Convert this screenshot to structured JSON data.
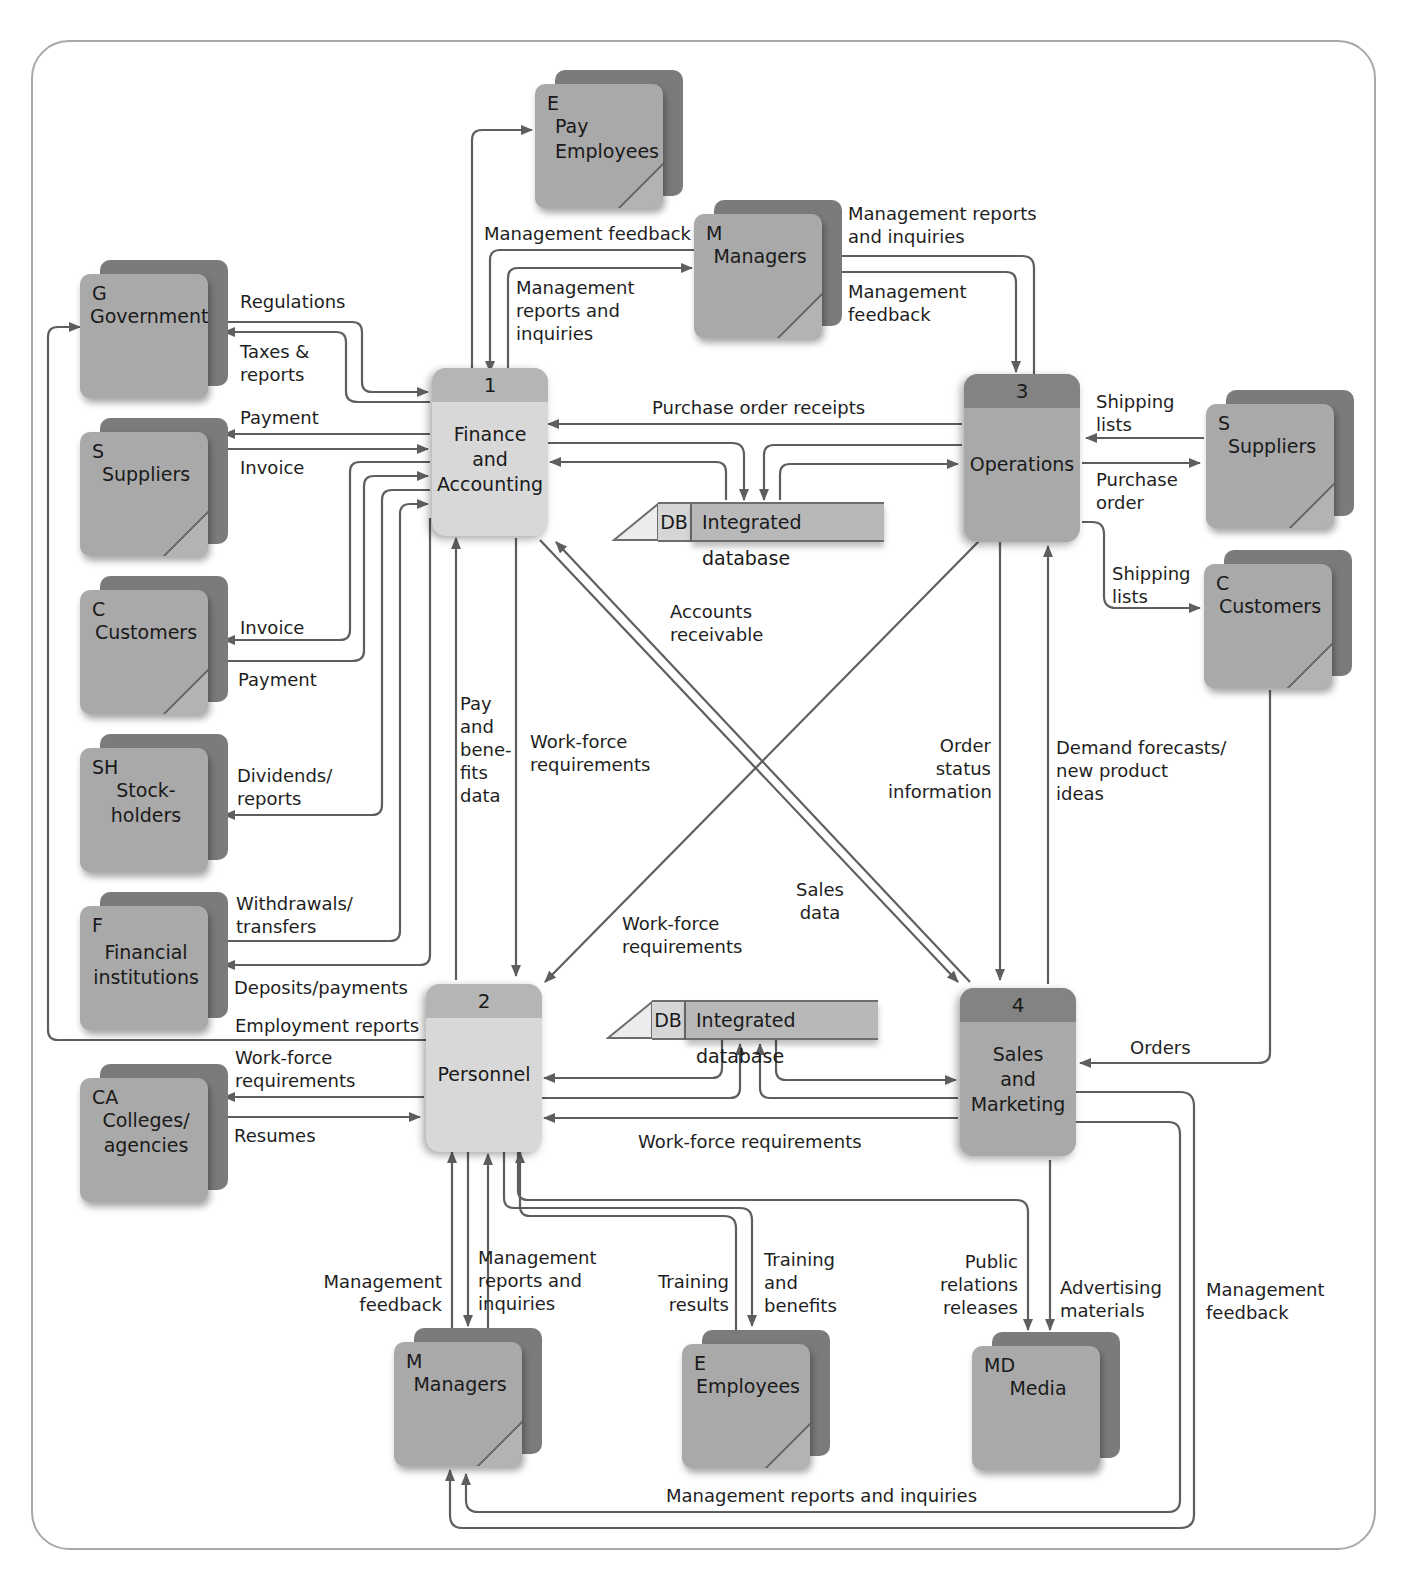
{
  "diagram": {
    "type": "data-flow-diagram",
    "processes": [
      {
        "id": "1",
        "name": "Finance and Accounting",
        "lines": [
          "Finance",
          "and",
          "Accounting"
        ]
      },
      {
        "id": "2",
        "name": "Personnel",
        "lines": [
          "Personnel"
        ]
      },
      {
        "id": "3",
        "name": "Operations",
        "lines": [
          "Operations"
        ]
      },
      {
        "id": "4",
        "name": "Sales and Marketing",
        "lines": [
          "Sales",
          "and",
          "Marketing"
        ]
      }
    ],
    "data_stores": [
      {
        "id": "DB",
        "name": "Integrated database"
      },
      {
        "id": "DB",
        "name": "Integrated database"
      }
    ],
    "entities": {
      "pay_employees": {
        "code": "E",
        "lines": [
          "Pay",
          "Employees"
        ]
      },
      "managers_top": {
        "code": "M",
        "lines": [
          "Managers"
        ]
      },
      "government": {
        "code": "G",
        "lines": [
          "Government"
        ]
      },
      "suppliers_left": {
        "code": "S",
        "lines": [
          "Suppliers"
        ]
      },
      "customers_left": {
        "code": "C",
        "lines": [
          "Customers"
        ]
      },
      "stockholders": {
        "code": "SH",
        "lines": [
          "Stock-",
          "holders"
        ]
      },
      "financial_institutions": {
        "code": "F",
        "lines": [
          "Financial",
          "institutions"
        ]
      },
      "colleges": {
        "code": "CA",
        "lines": [
          "Colleges/",
          "agencies"
        ]
      },
      "suppliers_right": {
        "code": "S",
        "lines": [
          "Suppliers"
        ]
      },
      "customers_right": {
        "code": "C",
        "lines": [
          "Customers"
        ]
      },
      "managers_bottom": {
        "code": "M",
        "lines": [
          "Managers"
        ]
      },
      "employees": {
        "code": "E",
        "lines": [
          "Employees"
        ]
      },
      "media": {
        "code": "MD",
        "lines": [
          "Media"
        ]
      }
    },
    "flows": {
      "mgmt_feedback_top": [
        "Management feedback"
      ],
      "mgmt_reports_top_left": [
        "Management",
        "reports and",
        "inquiries"
      ],
      "mgmt_reports_top_right": [
        "Management reports",
        "and inquiries"
      ],
      "mgmt_feedback_top_right": [
        "Management",
        "feedback"
      ],
      "regulations": [
        "Regulations"
      ],
      "taxes": [
        "Taxes &",
        "reports"
      ],
      "payment_suppliers": [
        "Payment"
      ],
      "invoice_suppliers": [
        "Invoice"
      ],
      "invoice_customers": [
        "Invoice"
      ],
      "payment_customers": [
        "Payment"
      ],
      "dividends": [
        "Dividends/",
        "reports"
      ],
      "withdrawals": [
        "Withdrawals/",
        "transfers"
      ],
      "deposits": [
        "Deposits/payments"
      ],
      "employment_reports": [
        "Employment reports"
      ],
      "workforce_colleges": [
        "Work-force",
        "requirements"
      ],
      "resumes": [
        "Resumes"
      ],
      "purchase_order_receipts": [
        "Purchase order receipts"
      ],
      "shipping_lists_suppliers": [
        "Shipping",
        "lists"
      ],
      "purchase_order": [
        "Purchase",
        "order"
      ],
      "shipping_lists_customers": [
        "Shipping",
        "lists"
      ],
      "accounts_receivable": [
        "Accounts",
        "receivable"
      ],
      "pay_benefits": [
        "Pay",
        "and",
        "bene-",
        "fits",
        "data"
      ],
      "workforce_req_1": [
        "Work-force",
        "requirements"
      ],
      "workforce_req_3": [
        "Work-force",
        "requirements"
      ],
      "sales_data": [
        "Sales",
        "data"
      ],
      "order_status": [
        "Order",
        "status",
        "information"
      ],
      "demand_forecasts": [
        "Demand forecasts/",
        "new product",
        "ideas"
      ],
      "orders": [
        "Orders"
      ],
      "workforce_req_4": [
        "Work-force requirements"
      ],
      "mgmt_feedback_bottom": [
        "Management",
        "feedback"
      ],
      "mgmt_reports_bottom": [
        "Management",
        "reports and",
        "inquiries"
      ],
      "training_results": [
        "Training",
        "results"
      ],
      "training_benefits": [
        "Training",
        "and",
        "benefits"
      ],
      "public_relations": [
        "Public",
        "relations",
        "releases"
      ],
      "advertising": [
        "Advertising",
        "materials"
      ],
      "mgmt_feedback_right": [
        "Management",
        "feedback"
      ],
      "mgmt_reports_bottom_long": [
        "Management reports and inquiries"
      ]
    },
    "colors": {
      "line": "#5e5e5e",
      "frame": "#a8a8a8",
      "entity_front": "#a9a9a9",
      "entity_back": "#7b7b7b",
      "process_light": "#d8d8d8",
      "process_dark": "#a9a9a9"
    }
  }
}
